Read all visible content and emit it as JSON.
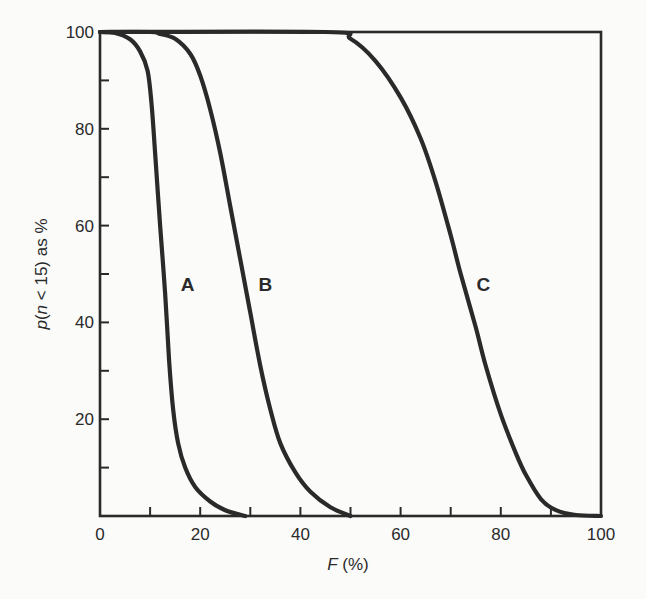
{
  "chart_data": {
    "type": "line",
    "title": "",
    "xlabel": "F (%)",
    "xlabel_italic": "F",
    "xlabel_suffix": " (%)",
    "ylabel": "p(n < 15) as %",
    "ylabel_parts": {
      "p": "p",
      "open": "(",
      "n": "n",
      "rest": " < 15) as %"
    },
    "xlim": [
      0,
      100
    ],
    "ylim": [
      0,
      100
    ],
    "x_ticks_major": [
      0,
      20,
      40,
      60,
      80,
      100
    ],
    "x_ticks_minor": [
      10,
      30,
      50,
      70,
      90
    ],
    "y_ticks_major": [
      20,
      40,
      60,
      80,
      100
    ],
    "y_ticks_minor": [
      10,
      30,
      50,
      70,
      90
    ],
    "x_tick_labels": [
      "0",
      "20",
      "40",
      "60",
      "80",
      "100"
    ],
    "y_tick_labels": [
      "20",
      "40",
      "60",
      "80",
      "100"
    ],
    "grid": false,
    "legend": "none (inline curve labels)",
    "line_color": "#2a2a2a",
    "series": [
      {
        "name": "A",
        "label_pos": {
          "x": 17.5,
          "y": 48
        },
        "points": [
          [
            0,
            100
          ],
          [
            3,
            99.8
          ],
          [
            6,
            98.5
          ],
          [
            8,
            96
          ],
          [
            9.5,
            92
          ],
          [
            10.3,
            85
          ],
          [
            11,
            75
          ],
          [
            12,
            60
          ],
          [
            13,
            46
          ],
          [
            13.8,
            32
          ],
          [
            14.6,
            22
          ],
          [
            15.6,
            15
          ],
          [
            17,
            10
          ],
          [
            19,
            6
          ],
          [
            22,
            3
          ],
          [
            25,
            1.2
          ],
          [
            29,
            0
          ]
        ]
      },
      {
        "name": "B",
        "label_pos": {
          "x": 33,
          "y": 48
        },
        "points": [
          [
            0,
            100
          ],
          [
            10,
            100
          ],
          [
            12,
            99.6
          ],
          [
            15,
            98.6
          ],
          [
            18,
            95.5
          ],
          [
            20,
            91
          ],
          [
            22,
            84
          ],
          [
            24,
            75
          ],
          [
            26,
            64
          ],
          [
            28,
            53
          ],
          [
            30,
            42
          ],
          [
            32,
            31
          ],
          [
            34,
            22
          ],
          [
            36,
            15
          ],
          [
            39,
            9
          ],
          [
            42,
            5
          ],
          [
            46,
            1.8
          ],
          [
            50,
            0
          ]
        ]
      },
      {
        "name": "C",
        "label_pos": {
          "x": 76.5,
          "y": 48
        },
        "points": [
          [
            0,
            100
          ],
          [
            45,
            100
          ],
          [
            50,
            98.6
          ],
          [
            55,
            94
          ],
          [
            60,
            86.5
          ],
          [
            64,
            78
          ],
          [
            67,
            69
          ],
          [
            70,
            58
          ],
          [
            72,
            50
          ],
          [
            75,
            39
          ],
          [
            77,
            31
          ],
          [
            80,
            21
          ],
          [
            83,
            13
          ],
          [
            85,
            8.5
          ],
          [
            88,
            3.5
          ],
          [
            91,
            1.2
          ],
          [
            95,
            0.2
          ],
          [
            100,
            0
          ]
        ]
      }
    ]
  }
}
